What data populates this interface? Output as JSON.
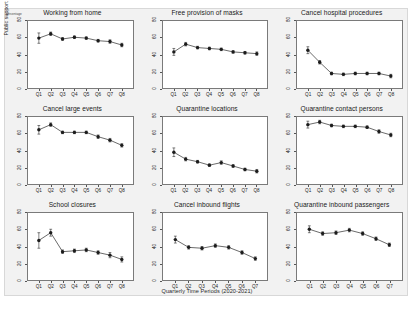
{
  "figure": {
    "ylabel": "Public support for Covid19 policies",
    "xlabel": "Quarterly Time Periods (2020-2021)",
    "percentage_tag": "percentage",
    "marker_color": "#1c1c1c",
    "line_color": "#2b2b2b",
    "panel_bg": "#ffffff",
    "figure_bg": "#f2f2f2"
  },
  "chart_data": {
    "type": "line",
    "title": "",
    "xlabel": "Quarterly Time Periods (2020-2021)",
    "ylabel": "Public support for Covid19 policies",
    "ylim": [
      0,
      80
    ],
    "yticks": [
      0,
      20,
      40,
      60,
      80
    ],
    "grid": false,
    "legend": "none",
    "units": "percentage",
    "error_bars": "95% confidence intervals",
    "panels": [
      {
        "title": "Working from home",
        "categories": [
          "Q1",
          "Q2",
          "Q3",
          "Q4",
          "Q5",
          "Q6",
          "Q7",
          "Q8"
        ],
        "values": [
          59,
          64,
          58,
          60,
          59,
          56,
          55,
          51
        ],
        "err_low": [
          53,
          62,
          56.5,
          58.5,
          57.5,
          54.5,
          53,
          49
        ],
        "err_high": [
          65,
          66,
          59.5,
          61.5,
          60.5,
          57.5,
          57,
          53
        ]
      },
      {
        "title": "Free provision of masks",
        "categories": [
          "Q1",
          "Q2",
          "Q3",
          "Q4",
          "Q5",
          "Q6",
          "Q7",
          "Q8"
        ],
        "values": [
          43,
          52,
          48,
          47,
          46,
          43,
          42,
          41
        ],
        "err_low": [
          39,
          50,
          46.5,
          45.5,
          44.5,
          41.5,
          40.5,
          39
        ],
        "err_high": [
          47,
          54,
          49.5,
          48.5,
          47.5,
          44.5,
          43.5,
          43
        ]
      },
      {
        "title": "Cancel hospital procedures",
        "categories": [
          "Q1",
          "Q2",
          "Q3",
          "Q4",
          "Q5",
          "Q6",
          "Q7",
          "Q8"
        ],
        "values": [
          45,
          31,
          18,
          17,
          18,
          18,
          18,
          15
        ],
        "err_low": [
          41,
          29,
          16.5,
          15.5,
          16.5,
          16.5,
          16.5,
          13
        ],
        "err_high": [
          49,
          33,
          19.5,
          18.5,
          19.5,
          19.5,
          19.5,
          17
        ]
      },
      {
        "title": "Cancel large events",
        "categories": [
          "Q1",
          "Q2",
          "Q3",
          "Q4",
          "Q5",
          "Q6",
          "Q7",
          "Q8"
        ],
        "values": [
          64,
          70,
          61,
          61,
          61,
          56,
          52,
          46
        ],
        "err_low": [
          59,
          68,
          59.5,
          59.5,
          59.5,
          54,
          50,
          44
        ],
        "err_high": [
          69,
          72,
          62.5,
          62.5,
          62.5,
          58,
          54,
          48
        ]
      },
      {
        "title": "Quarantine locations",
        "categories": [
          "Q1",
          "Q2",
          "Q3",
          "Q4",
          "Q5",
          "Q6",
          "Q7",
          "Q8"
        ],
        "values": [
          38,
          30,
          27,
          23,
          26,
          22,
          18,
          16
        ],
        "err_low": [
          33,
          28,
          25.5,
          21.5,
          24,
          20.5,
          16.5,
          14
        ],
        "err_high": [
          43,
          32,
          28.5,
          24.5,
          28,
          23.5,
          19.5,
          18
        ]
      },
      {
        "title": "Quarantine contact persons",
        "categories": [
          "Q1",
          "Q2",
          "Q3",
          "Q4",
          "Q5",
          "Q6",
          "Q7",
          "Q8"
        ],
        "values": [
          70,
          73,
          69,
          68,
          68,
          67,
          62,
          58
        ],
        "err_low": [
          66,
          71,
          67.5,
          66.5,
          66.5,
          65.5,
          60,
          56
        ],
        "err_high": [
          74,
          75,
          70.5,
          69.5,
          69.5,
          68.5,
          64,
          60
        ]
      },
      {
        "title": "School closures",
        "categories": [
          "Q1",
          "Q2",
          "Q3",
          "Q4",
          "Q5",
          "Q6",
          "Q7",
          "Q8"
        ],
        "values": [
          47,
          56,
          34,
          35,
          36,
          33,
          30,
          25
        ],
        "err_low": [
          38,
          52,
          32,
          33,
          34,
          31,
          27,
          22
        ],
        "err_high": [
          56,
          60,
          36,
          37,
          38,
          35,
          33,
          28
        ]
      },
      {
        "title": "Cancel inbound flights",
        "categories": [
          "Q1",
          "Q2",
          "Q3",
          "Q4",
          "Q5",
          "Q6",
          "Q7"
        ],
        "values": [
          48,
          39,
          38,
          41,
          39,
          33,
          26
        ],
        "err_low": [
          44,
          37,
          36,
          39,
          37,
          31,
          24
        ],
        "err_high": [
          52,
          41,
          40,
          43,
          41,
          35,
          28
        ]
      },
      {
        "title": "Quarantine inbound passengers",
        "categories": [
          "Q1",
          "Q2",
          "Q3",
          "Q4",
          "Q5",
          "Q6",
          "Q7"
        ],
        "values": [
          60,
          55,
          56,
          59,
          55,
          49,
          42
        ],
        "err_low": [
          56,
          53,
          54,
          57,
          53,
          47,
          40
        ],
        "err_high": [
          64,
          57,
          58,
          61,
          57,
          51,
          44
        ]
      }
    ]
  }
}
